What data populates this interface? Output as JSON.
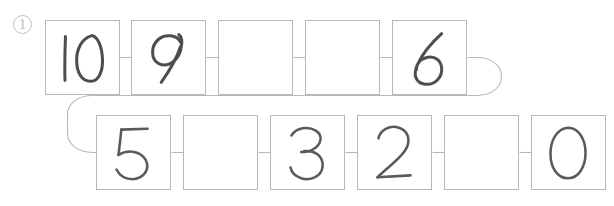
{
  "worksheet": {
    "question_marker": "1",
    "question_marker_name": "circled-number-one",
    "background_color": "#ffffff",
    "box_border_color": "#b8b8b8",
    "handwriting_color": "#4d4d4d",
    "marker_color": "#bdbdbd",
    "sequence_direction": "descending",
    "sequence_start": "10",
    "sequence_end": "0",
    "layout": "snake-two-rows-wrap"
  },
  "rows": [
    {
      "name": "top-row",
      "cells": [
        {
          "value": "10",
          "filled": true,
          "name": "cell-10"
        },
        {
          "value": "9",
          "filled": true,
          "name": "cell-9"
        },
        {
          "value": "",
          "filled": false,
          "name": "cell-blank-8"
        },
        {
          "value": "",
          "filled": false,
          "name": "cell-blank-7"
        },
        {
          "value": "6",
          "filled": true,
          "name": "cell-6"
        }
      ]
    },
    {
      "name": "bottom-row",
      "cells": [
        {
          "value": "5",
          "filled": true,
          "name": "cell-5"
        },
        {
          "value": "",
          "filled": false,
          "name": "cell-blank-4"
        },
        {
          "value": "3",
          "filled": true,
          "name": "cell-3"
        },
        {
          "value": "2",
          "filled": true,
          "name": "cell-2"
        },
        {
          "value": "",
          "filled": false,
          "name": "cell-blank-1"
        },
        {
          "value": "0",
          "filled": true,
          "name": "cell-0"
        }
      ]
    }
  ],
  "connectors": {
    "top_row_links": 4,
    "bottom_row_links": 5,
    "wrap_right_label": "wrap-right-curve",
    "wrap_left_label": "wrap-left-curve"
  }
}
